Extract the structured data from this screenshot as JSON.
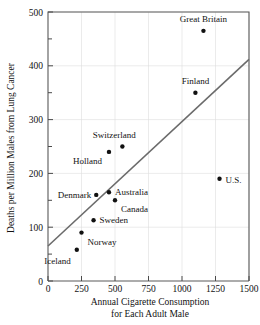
{
  "chart_data": {
    "type": "scatter",
    "title": "",
    "xlabel": "Annual Cigarette Consumption for Each Adult Male",
    "xlabel_line1": "Annual Cigarette Consumption",
    "xlabel_line2": "for Each Adult Male",
    "ylabel": "Deaths per Million Males from Lung Cancer",
    "xlim": [
      0,
      1500
    ],
    "ylim": [
      0,
      500
    ],
    "xticks": [
      0,
      250,
      500,
      750,
      1000,
      1250,
      1500
    ],
    "xtick_labels": [
      "0",
      "250",
      "500",
      "750",
      "1000",
      "1250",
      "1500"
    ],
    "yticks": [
      0,
      100,
      200,
      300,
      400,
      500
    ],
    "ytick_labels": [
      "0",
      "100",
      "200",
      "300",
      "400",
      "500"
    ],
    "y_minor_ticks": [
      50,
      150,
      250,
      350,
      450
    ],
    "grid": true,
    "legend": "none",
    "point_color": "#111111",
    "trendline_color": "#6b6b6b",
    "grid_color": "#dddddd",
    "axis_color": "#5a5a5a",
    "points": [
      {
        "label": "Great Britain",
        "x": 1160,
        "y": 465,
        "label_dx": 0,
        "label_dy": -9,
        "anchor": "middle"
      },
      {
        "label": "Finland",
        "x": 1100,
        "y": 350,
        "label_dx": 0,
        "label_dy": -9,
        "anchor": "middle"
      },
      {
        "label": "U.S.",
        "x": 1280,
        "y": 190,
        "label_dx": 6,
        "label_dy": 4,
        "anchor": "start"
      },
      {
        "label": "Switzerland",
        "x": 555,
        "y": 250,
        "label_dx": -8,
        "label_dy": -9,
        "anchor": "middle"
      },
      {
        "label": "Holland",
        "x": 455,
        "y": 240,
        "label_dx": -7,
        "label_dy": 12,
        "anchor": "end"
      },
      {
        "label": "Australia",
        "x": 455,
        "y": 165,
        "label_dx": 6,
        "label_dy": 3,
        "anchor": "start"
      },
      {
        "label": "Denmark",
        "x": 360,
        "y": 160,
        "label_dx": -5,
        "label_dy": 3,
        "anchor": "end"
      },
      {
        "label": "Canada",
        "x": 500,
        "y": 150,
        "label_dx": 6,
        "label_dy": 12,
        "anchor": "start"
      },
      {
        "label": "Sweden",
        "x": 340,
        "y": 113,
        "label_dx": 6,
        "label_dy": 3,
        "anchor": "start"
      },
      {
        "label": "Norway",
        "x": 250,
        "y": 90,
        "label_dx": 6,
        "label_dy": 12,
        "anchor": "start"
      },
      {
        "label": "Iceland",
        "x": 215,
        "y": 58,
        "label_dx": -6,
        "label_dy": 14,
        "anchor": "end"
      }
    ],
    "trendline": {
      "x0": 0,
      "y0": 65,
      "x1": 1500,
      "y1": 412
    }
  }
}
